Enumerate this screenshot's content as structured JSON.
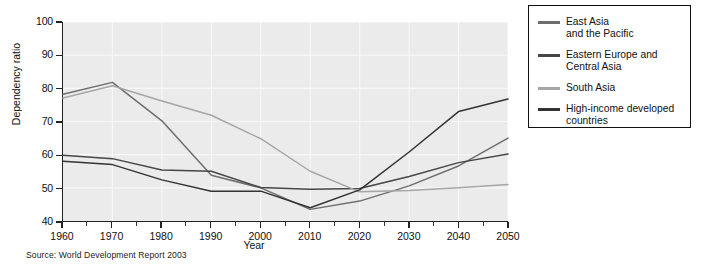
{
  "chart_data": {
    "type": "line",
    "title": "",
    "xlabel": "Year",
    "ylabel": "Dependency ratio",
    "xlim": [
      1960,
      2050
    ],
    "ylim": [
      40,
      100
    ],
    "ytick_values": [
      40,
      50,
      60,
      70,
      80,
      90,
      100
    ],
    "xtick_values": [
      1960,
      1970,
      1980,
      1990,
      2000,
      2010,
      2020,
      2030,
      2040,
      2050
    ],
    "xtick_labels": [
      "1960",
      "1970",
      "1980",
      "1990",
      "2000",
      "2010",
      "2020",
      "2030",
      "2040",
      "2050"
    ],
    "ytick_labels": [
      "40",
      "50",
      "60",
      "70",
      "80",
      "90",
      "100"
    ],
    "x": [
      1960,
      1970,
      1980,
      1990,
      2000,
      2010,
      2020,
      2030,
      2040,
      2050
    ],
    "minor_tick_interval": 5,
    "grid": true,
    "grid_color": "#f7f7f7",
    "plot_background": "#ebebeb",
    "legend_position": "right-outside",
    "series": [
      {
        "name": "East Asia\nand the Pacific",
        "label_lines": [
          "East Asia",
          "and the Pacific"
        ],
        "color": "#6e6e6e",
        "values": [
          78.2,
          81.8,
          70.2,
          53.8,
          50.0,
          43.5,
          46.0,
          50.6,
          56.6,
          65.0
        ]
      },
      {
        "name": "Eastern Europe and\nCentral Asia",
        "label_lines": [
          "Eastern Europe and",
          "Central Asia"
        ],
        "color": "#464646",
        "values": [
          59.8,
          58.8,
          55.4,
          55.0,
          50.1,
          49.6,
          49.8,
          53.4,
          57.6,
          60.2
        ]
      },
      {
        "name": "South Asia",
        "label_lines": [
          "South Asia"
        ],
        "color": "#a6a6a6",
        "values": [
          77.1,
          80.8,
          76.2,
          71.9,
          64.8,
          55.0,
          48.8,
          49.2,
          50.0,
          51.0
        ]
      },
      {
        "name": "High-income developed\ncountries",
        "label_lines": [
          "High-income developed",
          "countries"
        ],
        "color": "#333333",
        "values": [
          58.0,
          57.0,
          52.4,
          49.0,
          49.0,
          44.0,
          49.4,
          60.8,
          73.0,
          76.8
        ]
      }
    ]
  },
  "legend": {
    "items": [
      {
        "label": "East Asia\nand the Pacific",
        "color": "#6e6e6e"
      },
      {
        "label": "Eastern Europe and\nCentral Asia",
        "color": "#464646"
      },
      {
        "label": "South Asia",
        "color": "#a6a6a6"
      },
      {
        "label": "High-income developed\ncountries",
        "color": "#333333"
      }
    ]
  },
  "source": {
    "text": "Source: World Development Report 2003"
  }
}
